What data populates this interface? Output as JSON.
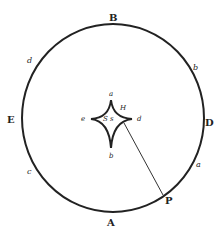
{
  "diagram": {
    "type": "geometric-figure",
    "colors": {
      "stroke": "#222222",
      "background": "#ffffff"
    },
    "circle": {
      "cx": 113,
      "cy": 118,
      "rx": 91,
      "ry": 94
    },
    "astroid": {
      "cx": 111,
      "cy": 124,
      "top": 100,
      "bottom": 148,
      "left": 91,
      "right": 132
    },
    "line": {
      "x1": 124,
      "y1": 123,
      "x2": 163,
      "y2": 195
    },
    "labels": {
      "B": "B",
      "A": "A",
      "E": "E",
      "D": "D",
      "P": "P",
      "outer_d": "d",
      "outer_b": "b",
      "outer_c": "c",
      "outer_a": "a",
      "inner_a": "a",
      "inner_b": "b",
      "inner_d": "d",
      "inner_e": "e",
      "inner_H": "H",
      "inner_S": "S s"
    }
  }
}
